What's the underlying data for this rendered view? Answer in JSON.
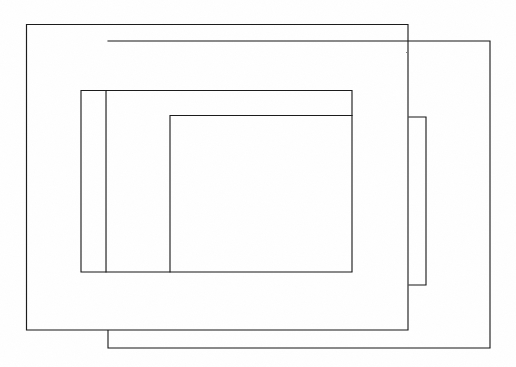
{
  "figure": {
    "background_color": "#ffffff",
    "stroke_color": "#1a1a1a",
    "stroke_width": 1.15,
    "canvas": {
      "width": 516,
      "height": 367
    },
    "style": "hand-drawn scanned line art, no fill, no text labels"
  },
  "chart_data": {
    "type": "diagram",
    "xlabel": "",
    "ylabel": "",
    "xlim": [
      0,
      516
    ],
    "ylim": [
      0,
      367
    ],
    "grid": false,
    "legend": "none",
    "annotations": [],
    "shapes": [
      {
        "name": "outer-rectangle",
        "order": 1,
        "kind": "rectangle",
        "x": 26,
        "y": 24,
        "width": 382,
        "height": 306,
        "x2": 408,
        "y2": 330,
        "stroke": "#1a1a1a",
        "fill": "none"
      },
      {
        "name": "offset-rectangle",
        "order": 2,
        "kind": "rectangle",
        "x": 108,
        "y": 41,
        "width": 382,
        "height": 307,
        "x2": 490,
        "y2": 348,
        "stroke": "#1a1a1a",
        "fill": "none"
      },
      {
        "name": "right-narrow-strip",
        "order": 3,
        "kind": "rectangle",
        "x": 409,
        "y": 117,
        "width": 17,
        "height": 168,
        "x2": 426,
        "y2": 285,
        "stroke": "#1a1a1a",
        "fill": "none"
      },
      {
        "name": "middle-rectangle",
        "order": 4,
        "kind": "rectangle",
        "x": 81,
        "y": 90,
        "width": 271,
        "height": 182,
        "x2": 352,
        "y2": 272,
        "stroke": "#1a1a1a",
        "fill": "none"
      },
      {
        "name": "left-narrow-strip",
        "order": 5,
        "kind": "rectangle",
        "x": 106,
        "y": 90,
        "width": 246,
        "height": 182,
        "x2": 352,
        "y2": 272,
        "stroke": "#1a1a1a",
        "fill": "none"
      },
      {
        "name": "inner-rectangle",
        "order": 6,
        "kind": "rectangle",
        "x": 170,
        "y": 115,
        "width": 182,
        "height": 157,
        "x2": 352,
        "y2": 272,
        "stroke": "#1a1a1a",
        "fill": "none"
      }
    ],
    "paths": {
      "outer_rectangle": "M26.5,24.5 L408,24.5 L408,330 L26.5,330 Z",
      "offset_rectangle": "M108,41 L490,41 L490,348 L108,348 L108,330.5",
      "right_narrow_strip": "M409,117 L426,117 L426,285 L409,285",
      "middle_rectangle": "M81,90.5 L352,90.5 L352,272 L81,272 Z",
      "left_narrow_strip": "M106,90.5 L106,272",
      "inner_rectangle": "M170,115.5 L352,115.5 M170,115.5 L170,272"
    }
  }
}
